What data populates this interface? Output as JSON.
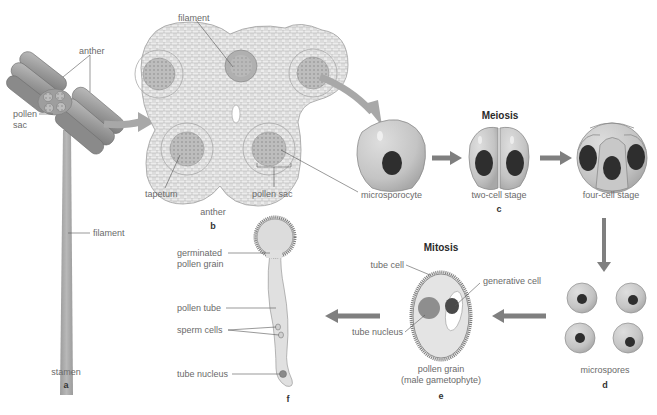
{
  "figure": {
    "type": "biology-diagram",
    "colors": {
      "cell_fill": "#c8c8c8",
      "cell_outline": "#8c8c8c",
      "nucleus": "#2e2e2e",
      "arrow": "#8a8a8a",
      "tissue_fill": "#e6e6e6",
      "label_text": "#6a6a6a",
      "leader_line": "#555555"
    }
  },
  "panels": {
    "a": {
      "letter": "a",
      "caption": "stamen",
      "labels": {
        "anther": "anther",
        "pollen_sac": "pollen\nsac",
        "pollen_sac_line1": "pollen",
        "pollen_sac_line2": "sac",
        "filament": "filament"
      }
    },
    "b": {
      "letter": "b",
      "caption": "anther",
      "labels": {
        "filament": "filament",
        "tapetum": "tapetum",
        "pollen_sac": "pollen sac",
        "microsporocyte": "microsporocyte"
      }
    },
    "c": {
      "letter": "c",
      "process": "Meiosis",
      "stages": [
        "microsporocyte",
        "two-cell stage",
        "four-cell stage"
      ]
    },
    "d": {
      "letter": "d",
      "caption": "microspores"
    },
    "e": {
      "letter": "e",
      "process": "Mitosis",
      "caption_line1": "pollen grain",
      "caption_line2": "(male gametophyte)",
      "labels": {
        "tube_cell": "tube cell",
        "generative_cell": "generative cell",
        "tube_nucleus": "tube nucleus"
      }
    },
    "f": {
      "letter": "f",
      "labels": {
        "germinated_line1": "germinated",
        "germinated_line2": "pollen grain",
        "pollen_tube": "pollen tube",
        "sperm_cells": "sperm cells",
        "tube_nucleus": "tube nucleus"
      }
    }
  }
}
